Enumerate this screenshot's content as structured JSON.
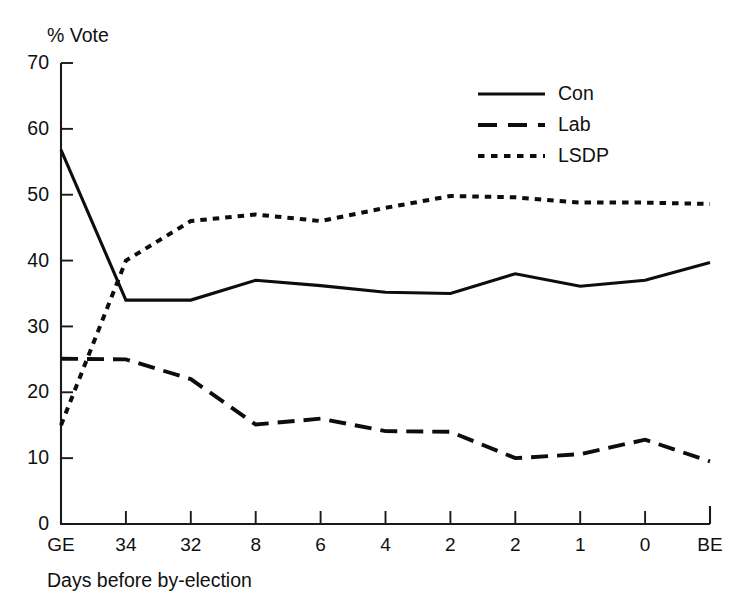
{
  "chart_data": {
    "type": "line",
    "title": "",
    "xlabel": "Days before by-election",
    "ylabel": "% Vote",
    "categories": [
      "GE",
      "34",
      "32",
      "8",
      "6",
      "4",
      "2",
      "2",
      "1",
      "0",
      "BE"
    ],
    "xtick_labels": [
      "GE",
      "34",
      "32",
      "8",
      "6",
      "4",
      "2",
      "2",
      "1",
      "0",
      "BE"
    ],
    "ytick_labels": [
      "0",
      "10",
      "20",
      "30",
      "40",
      "50",
      "60",
      "70"
    ],
    "yticks": [
      0,
      10,
      20,
      30,
      40,
      50,
      60,
      70
    ],
    "ylim": [
      0,
      70
    ],
    "grid": false,
    "legend_position": "top-right",
    "series": [
      {
        "name": "Con",
        "style": "solid",
        "color": "#0d0d0d",
        "values": [
          56.8,
          34.0,
          34.0,
          37.0,
          36.2,
          35.2,
          35.0,
          38.0,
          36.1,
          37.0,
          39.7
        ]
      },
      {
        "name": "Lab",
        "style": "dashed",
        "color": "#0d0d0d",
        "values": [
          25.1,
          25.0,
          22.0,
          15.1,
          16.0,
          14.1,
          14.0,
          10.0,
          10.6,
          12.8,
          9.5
        ]
      },
      {
        "name": "LSDP",
        "style": "dotted",
        "color": "#0d0d0d",
        "values": [
          15.0,
          40.0,
          46.0,
          47.0,
          46.0,
          48.0,
          49.8,
          49.6,
          48.8,
          48.8,
          48.6
        ]
      }
    ]
  },
  "legend": {
    "entries": [
      {
        "label": "Con",
        "style": "solid"
      },
      {
        "label": "Lab",
        "style": "dashed"
      },
      {
        "label": "LSDP",
        "style": "dotted"
      }
    ]
  },
  "axes": {
    "y_title": "% Vote",
    "x_title": "Days before by-election"
  }
}
